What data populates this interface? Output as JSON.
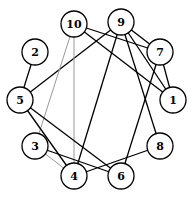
{
  "graph": {
    "nodes": [
      {
        "id": "1",
        "x": 173,
        "y": 100
      },
      {
        "id": "2",
        "x": 35,
        "y": 52
      },
      {
        "id": "3",
        "x": 35,
        "y": 146
      },
      {
        "id": "4",
        "x": 74,
        "y": 176
      },
      {
        "id": "5",
        "x": 20,
        "y": 100
      },
      {
        "id": "6",
        "x": 121,
        "y": 176
      },
      {
        "id": "7",
        "x": 160,
        "y": 52
      },
      {
        "id": "8",
        "x": 160,
        "y": 146
      },
      {
        "id": "9",
        "x": 121,
        "y": 22
      },
      {
        "id": "10",
        "x": 74,
        "y": 24
      }
    ],
    "edges": [
      {
        "from": "9",
        "to": "7",
        "style": "black"
      },
      {
        "from": "9",
        "to": "1",
        "style": "black"
      },
      {
        "from": "9",
        "to": "5",
        "style": "black"
      },
      {
        "from": "9",
        "to": "4",
        "style": "black"
      },
      {
        "from": "9",
        "to": "8",
        "style": "black"
      },
      {
        "from": "10",
        "to": "7",
        "style": "black"
      },
      {
        "from": "10",
        "to": "1",
        "style": "black"
      },
      {
        "from": "10",
        "to": "4",
        "style": "gray"
      },
      {
        "from": "10",
        "to": "3",
        "style": "gray"
      },
      {
        "from": "7",
        "to": "1",
        "style": "black"
      },
      {
        "from": "7",
        "to": "6",
        "style": "black"
      },
      {
        "from": "2",
        "to": "5",
        "style": "black"
      },
      {
        "from": "5",
        "to": "4",
        "style": "black"
      },
      {
        "from": "5",
        "to": "6",
        "style": "black"
      },
      {
        "from": "3",
        "to": "6",
        "style": "black"
      },
      {
        "from": "3",
        "to": "4",
        "style": "gray"
      },
      {
        "from": "4",
        "to": "8",
        "style": "black"
      }
    ],
    "node_radius": 13
  }
}
